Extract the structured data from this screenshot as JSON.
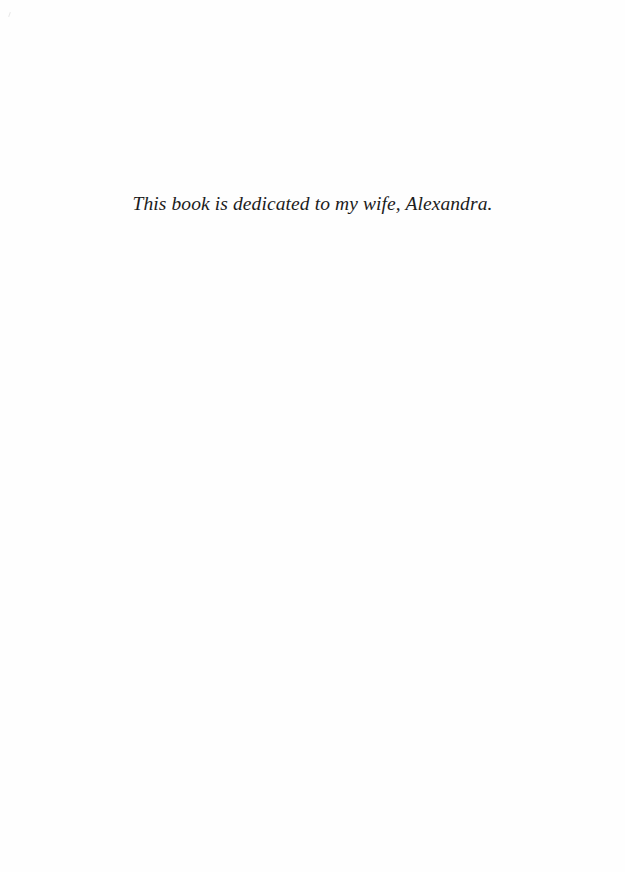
{
  "page": {
    "dedication": "This book is dedicated to my wife, Alexandra."
  }
}
